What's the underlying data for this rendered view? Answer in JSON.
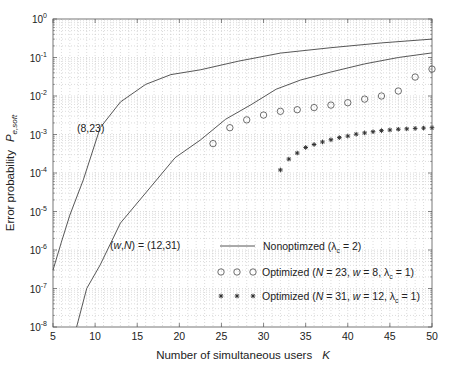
{
  "chart_data": {
    "type": "line",
    "title": "",
    "xlabel": "Number of simultaneous users",
    "xlabel_symbol": "K",
    "ylabel": "Error probability",
    "ylabel_symbol": "P",
    "ylabel_subscript": "e,soft",
    "xlim": [
      5,
      50
    ],
    "ylim": [
      1e-08,
      1
    ],
    "yscale": "log",
    "grid": true,
    "x_ticks": [
      5,
      10,
      15,
      20,
      25,
      30,
      35,
      40,
      45,
      50
    ],
    "y_ticks": [
      {
        "exp": "0",
        "value": 1
      },
      {
        "exp": "-1",
        "value": 0.1
      },
      {
        "exp": "-2",
        "value": 0.01
      },
      {
        "exp": "-3",
        "value": 0.001
      },
      {
        "exp": "-4",
        "value": 0.0001
      },
      {
        "exp": "-5",
        "value": 1e-05
      },
      {
        "exp": "-6",
        "value": 1e-06
      },
      {
        "exp": "-7",
        "value": 1e-07
      },
      {
        "exp": "-8",
        "value": 1e-08
      }
    ],
    "series": [
      {
        "name": "Nonoptimized (8,23)",
        "style": "line",
        "x": [
          5,
          6,
          7,
          8.6,
          10.6,
          13,
          16,
          19,
          22.5,
          27,
          32,
          38,
          44,
          50
        ],
        "y": [
          3e-07,
          1.6e-06,
          8e-06,
          6.6e-05,
          0.0015,
          0.007,
          0.02,
          0.036,
          0.048,
          0.08,
          0.13,
          0.18,
          0.24,
          0.3
        ]
      },
      {
        "name": "Nonoptimized (12,31)",
        "style": "line",
        "x": [
          7.8,
          9,
          10.6,
          13,
          16.5,
          19.5,
          22.5,
          25.5,
          28.5,
          31.5,
          34.4,
          38,
          42,
          46,
          50
        ],
        "y": [
          1e-08,
          1e-07,
          4.1e-07,
          5e-06,
          4.1e-05,
          0.00025,
          0.00072,
          0.0025,
          0.0059,
          0.015,
          0.026,
          0.042,
          0.068,
          0.1,
          0.132
        ]
      },
      {
        "name": "Optimized (N = 23, w = 8, λc = 1)",
        "style": "circle",
        "x": [
          24,
          26,
          28,
          30,
          32,
          34,
          36,
          38,
          40,
          42,
          44,
          46,
          48,
          50
        ],
        "y": [
          0.00058,
          0.0015,
          0.0024,
          0.0032,
          0.004,
          0.0044,
          0.005,
          0.0058,
          0.0067,
          0.0083,
          0.01,
          0.0135,
          0.031,
          0.05
        ]
      },
      {
        "name": "Optimized (N = 31, w = 12, λc = 1)",
        "style": "star",
        "x": [
          32,
          33,
          34,
          35,
          36,
          37,
          38,
          39,
          40,
          41,
          42,
          43,
          44,
          45,
          46,
          47,
          48,
          49,
          50
        ],
        "y": [
          0.00012,
          0.00023,
          0.00033,
          0.00046,
          0.00055,
          0.00064,
          0.00073,
          0.00083,
          0.00091,
          0.00102,
          0.0011,
          0.00118,
          0.00126,
          0.00131,
          0.00137,
          0.0014,
          0.00144,
          0.00147,
          0.0015
        ]
      }
    ],
    "legend": {
      "position": "lower right",
      "entries": [
        {
          "marker": "line",
          "text": "Nonoptimzed (λ",
          "sub": "c",
          "tail": " = 2)"
        },
        {
          "marker": "circle",
          "text_parts": [
            "Optimized (",
            "N",
            " = 23, ",
            "w",
            " = 8, λ"
          ],
          "sub": "c",
          "tail": " = 1)"
        },
        {
          "marker": "star",
          "text_parts": [
            "Optimized (",
            "N",
            " = 31, ",
            "w",
            " = 12, λ"
          ],
          "sub": "c",
          "tail": " = 1)"
        }
      ]
    },
    "annotations": [
      {
        "text": "(8,23)",
        "x_px": 77,
        "y_px": 132
      },
      {
        "text_parts": [
          "(",
          "w",
          ",",
          "N",
          ") = (12,31)"
        ],
        "x_px": 110,
        "y_px": 249
      }
    ]
  },
  "colors": {
    "axis": "#555555",
    "grid": "#b8b8b8",
    "line": "#444444",
    "marker": "#333333",
    "text": "#222222"
  }
}
